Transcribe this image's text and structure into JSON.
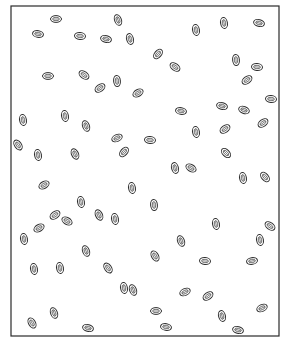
{
  "figure": {
    "title": "",
    "frame": {
      "x": 11,
      "y": 6,
      "width": 268,
      "height": 330,
      "stroke": "#2a2a2a"
    },
    "seed_size": {
      "rx": 5.5,
      "ry": 3.4
    },
    "seeds": [
      {
        "cx": 56,
        "cy": 19,
        "rot": 0
      },
      {
        "cx": 118,
        "cy": 20,
        "rot": 70
      },
      {
        "cx": 38,
        "cy": 34,
        "rot": 10
      },
      {
        "cx": 80,
        "cy": 36,
        "rot": 5
      },
      {
        "cx": 106,
        "cy": 39,
        "rot": 15
      },
      {
        "cx": 130,
        "cy": 39,
        "rot": 75
      },
      {
        "cx": 196,
        "cy": 30,
        "rot": 80
      },
      {
        "cx": 224,
        "cy": 23,
        "rot": 80
      },
      {
        "cx": 259,
        "cy": 23,
        "rot": 15
      },
      {
        "cx": 158,
        "cy": 54,
        "rot": -50
      },
      {
        "cx": 175,
        "cy": 67,
        "rot": 35
      },
      {
        "cx": 236,
        "cy": 60,
        "rot": 85
      },
      {
        "cx": 257,
        "cy": 67,
        "rot": 5
      },
      {
        "cx": 48,
        "cy": 76,
        "rot": 0
      },
      {
        "cx": 84,
        "cy": 75,
        "rot": 35
      },
      {
        "cx": 117,
        "cy": 81,
        "rot": 85
      },
      {
        "cx": 100,
        "cy": 88,
        "rot": -35
      },
      {
        "cx": 138,
        "cy": 93,
        "rot": -30
      },
      {
        "cx": 247,
        "cy": 80,
        "rot": -35
      },
      {
        "cx": 271,
        "cy": 99,
        "rot": 5
      },
      {
        "cx": 23,
        "cy": 120,
        "rot": 80
      },
      {
        "cx": 65,
        "cy": 116,
        "rot": 80
      },
      {
        "cx": 86,
        "cy": 126,
        "rot": 70
      },
      {
        "cx": 117,
        "cy": 138,
        "rot": -25
      },
      {
        "cx": 124,
        "cy": 152,
        "rot": -50
      },
      {
        "cx": 150,
        "cy": 140,
        "rot": 5
      },
      {
        "cx": 181,
        "cy": 111,
        "rot": 10
      },
      {
        "cx": 222,
        "cy": 106,
        "rot": 15
      },
      {
        "cx": 244,
        "cy": 110,
        "rot": 20
      },
      {
        "cx": 263,
        "cy": 123,
        "rot": -35
      },
      {
        "cx": 196,
        "cy": 132,
        "rot": 80
      },
      {
        "cx": 225,
        "cy": 129,
        "rot": -35
      },
      {
        "cx": 18,
        "cy": 145,
        "rot": 55
      },
      {
        "cx": 38,
        "cy": 155,
        "rot": 80
      },
      {
        "cx": 75,
        "cy": 154,
        "rot": 65
      },
      {
        "cx": 226,
        "cy": 153,
        "rot": 45
      },
      {
        "cx": 191,
        "cy": 168,
        "rot": 30
      },
      {
        "cx": 175,
        "cy": 168,
        "rot": 75
      },
      {
        "cx": 243,
        "cy": 178,
        "rot": 80
      },
      {
        "cx": 265,
        "cy": 177,
        "rot": 50
      },
      {
        "cx": 44,
        "cy": 185,
        "rot": -30
      },
      {
        "cx": 132,
        "cy": 188,
        "rot": 80
      },
      {
        "cx": 81,
        "cy": 202,
        "rot": 80
      },
      {
        "cx": 154,
        "cy": 205,
        "rot": 85
      },
      {
        "cx": 55,
        "cy": 215,
        "rot": -35
      },
      {
        "cx": 67,
        "cy": 221,
        "rot": 30
      },
      {
        "cx": 99,
        "cy": 215,
        "rot": 65
      },
      {
        "cx": 115,
        "cy": 219,
        "rot": 80
      },
      {
        "cx": 39,
        "cy": 228,
        "rot": -30
      },
      {
        "cx": 24,
        "cy": 239,
        "rot": 80
      },
      {
        "cx": 86,
        "cy": 251,
        "rot": 70
      },
      {
        "cx": 181,
        "cy": 241,
        "rot": 70
      },
      {
        "cx": 216,
        "cy": 224,
        "rot": 80
      },
      {
        "cx": 270,
        "cy": 226,
        "rot": 35
      },
      {
        "cx": 260,
        "cy": 240,
        "rot": 80
      },
      {
        "cx": 155,
        "cy": 256,
        "rot": 60
      },
      {
        "cx": 205,
        "cy": 261,
        "rot": 5
      },
      {
        "cx": 252,
        "cy": 261,
        "rot": -10
      },
      {
        "cx": 34,
        "cy": 269,
        "rot": 80
      },
      {
        "cx": 60,
        "cy": 268,
        "rot": 80
      },
      {
        "cx": 108,
        "cy": 268,
        "rot": 55
      },
      {
        "cx": 133,
        "cy": 290,
        "rot": 70
      },
      {
        "cx": 124,
        "cy": 288,
        "rot": 80
      },
      {
        "cx": 185,
        "cy": 292,
        "rot": -25
      },
      {
        "cx": 208,
        "cy": 296,
        "rot": -35
      },
      {
        "cx": 156,
        "cy": 311,
        "rot": 0
      },
      {
        "cx": 222,
        "cy": 316,
        "rot": 75
      },
      {
        "cx": 262,
        "cy": 308,
        "rot": -25
      },
      {
        "cx": 54,
        "cy": 313,
        "rot": 70
      },
      {
        "cx": 32,
        "cy": 323,
        "rot": 60
      },
      {
        "cx": 88,
        "cy": 328,
        "rot": 15
      },
      {
        "cx": 166,
        "cy": 327,
        "rot": 10
      },
      {
        "cx": 238,
        "cy": 330,
        "rot": 15
      }
    ]
  }
}
